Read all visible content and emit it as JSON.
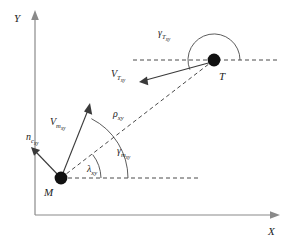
{
  "figure": {
    "background_color": "#ffffff",
    "axes": {
      "x_label": "X",
      "y_label": "Y",
      "axis_color": "#8a8a8a"
    },
    "points": [
      {
        "id": "missile",
        "label": "M",
        "x": 61,
        "y": 178
      },
      {
        "id": "target",
        "label": "T",
        "x": 214,
        "y": 60
      }
    ],
    "vectors": [
      {
        "id": "missile-velocity",
        "label": "V",
        "sub": "m",
        "sub2": "xy",
        "from": "M",
        "direction": "up-right"
      },
      {
        "id": "commanded-acceleration",
        "label": "n",
        "sub": "c",
        "sub2": "xy",
        "from": "M",
        "direction": "up-left"
      },
      {
        "id": "target-velocity",
        "label": "V",
        "sub": "T",
        "sub2": "xy",
        "from": "T",
        "direction": "left-down"
      }
    ],
    "ranges": [
      {
        "id": "line-of-sight",
        "label": "ρ",
        "sub": "xy",
        "style": "dashed",
        "from": "M",
        "to": "T"
      }
    ],
    "angles": [
      {
        "id": "line-of-sight-angle",
        "label": "λ",
        "sub": "xy",
        "vertex": "M",
        "between": [
          "horizontal-reference",
          "line-of-sight"
        ]
      },
      {
        "id": "missile-flight-path-angle",
        "label": "γ",
        "sub": "m",
        "sub2": "xy",
        "vertex": "M",
        "between": [
          "horizontal-reference",
          "missile-velocity"
        ]
      },
      {
        "id": "target-flight-path-angle",
        "label": "γ",
        "sub": "T",
        "sub2": "xy",
        "vertex": "T",
        "between": [
          "horizontal-reference",
          "target-velocity"
        ]
      }
    ],
    "reference_lines": [
      {
        "id": "missile-horizontal",
        "style": "dashed",
        "from": "M",
        "direction": "right"
      },
      {
        "id": "target-horizontal",
        "style": "dashed",
        "through": "T",
        "direction": "horizontal"
      }
    ]
  }
}
